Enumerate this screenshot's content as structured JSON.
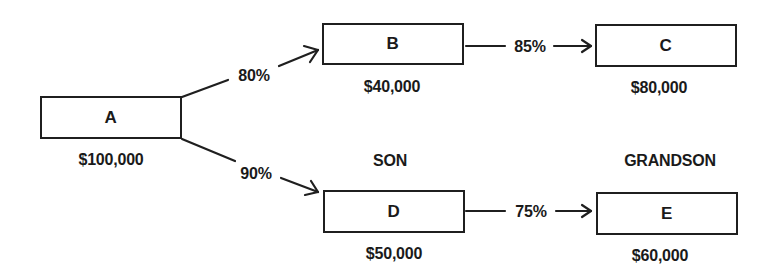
{
  "diagram": {
    "nodes": [
      {
        "id": "A",
        "label": "A",
        "value": "$100,000",
        "role": ""
      },
      {
        "id": "B",
        "label": "B",
        "value": "$40,000",
        "role": ""
      },
      {
        "id": "C",
        "label": "C",
        "value": "$80,000",
        "role": ""
      },
      {
        "id": "D",
        "label": "D",
        "value": "$50,000",
        "role": "SON"
      },
      {
        "id": "E",
        "label": "E",
        "value": "$60,000",
        "role": "GRANDSON"
      }
    ],
    "edges": [
      {
        "from": "A",
        "to": "B",
        "label": "80%"
      },
      {
        "from": "A",
        "to": "D",
        "label": "90%"
      },
      {
        "from": "B",
        "to": "C",
        "label": "85%"
      },
      {
        "from": "D",
        "to": "E",
        "label": "75%"
      }
    ],
    "column_labels": {
      "son": "SON",
      "grandson": "GRANDSON"
    }
  }
}
